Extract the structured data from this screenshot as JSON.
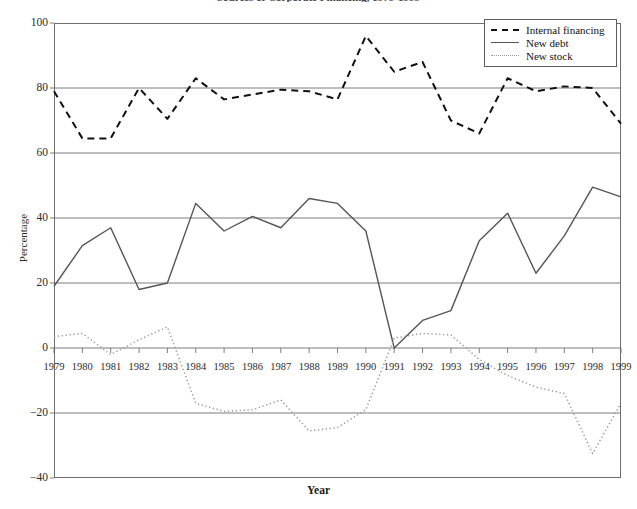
{
  "chart_data": {
    "type": "line",
    "title": "Sources of Corporate Financing, 1979-1999",
    "xlabel": "Year",
    "ylabel": "Percentage",
    "categories": [
      1979,
      1980,
      1981,
      1982,
      1983,
      1984,
      1985,
      1986,
      1987,
      1988,
      1989,
      1990,
      1991,
      1992,
      1993,
      1994,
      1995,
      1996,
      1997,
      1998,
      1999
    ],
    "xlim": [
      1979,
      1999
    ],
    "ylim": [
      -40,
      100
    ],
    "yticks": [
      100,
      80,
      60,
      40,
      20,
      0,
      -20,
      -40
    ],
    "xticks": [
      "1979",
      "1980",
      "1981",
      "1982",
      "1983",
      "1984",
      "1985",
      "1986",
      "1987",
      "1988",
      "1989",
      "1990",
      "1991",
      "1992",
      "1993",
      "1994",
      "1995",
      "1996",
      "1997",
      "1998",
      "1999"
    ],
    "grid": "horizontal-major",
    "legend_position": "top-right",
    "series": [
      {
        "name": "Internal financing",
        "style": "dashed",
        "color": "#111111",
        "values": [
          79,
          64.5,
          64.5,
          80,
          70.5,
          83,
          76.5,
          78,
          79.5,
          79,
          76.5,
          96,
          85,
          88,
          70,
          66,
          83,
          79,
          80.5,
          80,
          69
        ]
      },
      {
        "name": "New debt",
        "style": "solid",
        "color": "#555555",
        "values": [
          19,
          31.5,
          37,
          18,
          20,
          44.5,
          36,
          40.5,
          37,
          46,
          44.5,
          36,
          0,
          8.5,
          11.5,
          33,
          41.5,
          23,
          34.5,
          49.5,
          46.5
        ]
      },
      {
        "name": "New stock",
        "style": "dotted",
        "color": "#9a9a9a",
        "values": [
          3.5,
          4.5,
          -2,
          2.5,
          6.5,
          -17,
          -19.5,
          -19,
          -16,
          -25.5,
          -24.5,
          -19,
          3,
          4.5,
          4,
          -3.5,
          -8.5,
          -12,
          -14,
          -32.5,
          -17
        ]
      }
    ]
  },
  "legend": {
    "items": [
      {
        "label": "Internal financing",
        "swatch": "dashed-line-swatch"
      },
      {
        "label": "New debt",
        "swatch": "solid-line-swatch"
      },
      {
        "label": "New stock",
        "swatch": "dotted-line-swatch"
      }
    ]
  }
}
